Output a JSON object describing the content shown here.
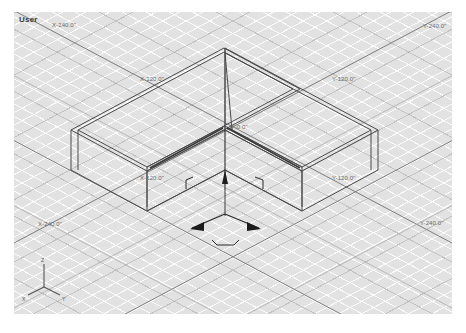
{
  "app": {
    "kind": "3d-modeling-viewport",
    "view_label": "User"
  },
  "colors": {
    "viewport_bg": "#e2e2e2",
    "grid_fine": "#f2f2f2",
    "grid_major": "#9a9a9a",
    "geometry_edge": "#4a4a4a",
    "gizmo": "#2b2b2b",
    "label_text": "#6a6a6a",
    "page_bg": "#ffffff"
  },
  "grid_labels": [
    {
      "id": "label-top-left",
      "text": "X-240.0\"",
      "x": 38,
      "y": 10
    },
    {
      "id": "label-top-right",
      "text": "Y-240.0\"",
      "x": 424,
      "y": 11
    },
    {
      "id": "label-upper-left",
      "text": "X-120.0\"",
      "x": 133,
      "y": 64
    },
    {
      "id": "label-upper-right",
      "text": "Y-120.0\"",
      "x": 330,
      "y": 64
    },
    {
      "id": "label-origin",
      "text": "0'-0.0\"",
      "x": 238,
      "y": 117
    },
    {
      "id": "label-mid-left",
      "text": "X-120.0\"",
      "x": 136,
      "y": 170
    },
    {
      "id": "label-mid-right",
      "text": "Y-120.0\"",
      "x": 330,
      "y": 170
    },
    {
      "id": "label-lower-left",
      "text": "X-240.0\"",
      "x": 36,
      "y": 220
    },
    {
      "id": "label-lower-right",
      "text": "Y-240.0\"",
      "x": 430,
      "y": 219
    }
  ],
  "axis_tripod": {
    "label_z": "Z",
    "label_x": "X",
    "label_y": "Y"
  },
  "gizmo": {
    "name": "translate-gizmo",
    "axes": [
      "X",
      "Y",
      "Z"
    ],
    "x_axis_label": "X",
    "y_axis_label": "Y",
    "z_axis_label": "Z"
  },
  "geometry": {
    "name": "l-shaped-wall-mass",
    "description": "isometric wireframe L-shaped building mass with wall thickness"
  }
}
